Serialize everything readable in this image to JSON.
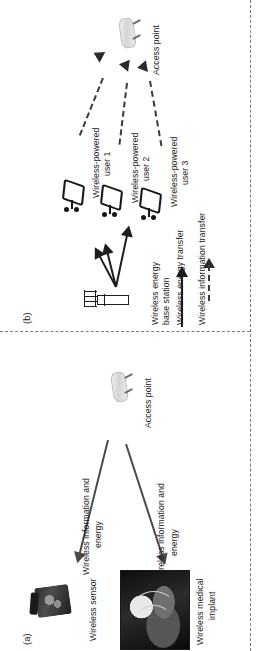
{
  "figure": {
    "orientation": "rotated-90",
    "panels": [
      {
        "id": "panel-a",
        "label": "(a)",
        "nodes": [
          {
            "name": "access-point",
            "label": "Access point",
            "icon": "wireless-router-icon"
          },
          {
            "name": "wireless-sensor",
            "label": "Wireless sensor",
            "icon": "sensor-photo"
          },
          {
            "name": "wireless-medical-implant",
            "label": "Wireless medical\nimplant",
            "label_line1": "Wireless medical",
            "label_line2": "implant",
            "icon": "xray-torso-photo"
          }
        ],
        "edges": [
          {
            "name": "edge-ap-to-sensor",
            "label_line1": "Wireless information and",
            "label_line2": "energy",
            "style": "solid-arrow"
          },
          {
            "name": "edge-ap-to-implant",
            "label_line1": "Wireless information and",
            "label_line2": "energy",
            "style": "solid-arrow"
          }
        ]
      },
      {
        "id": "panel-b",
        "label": "(b)",
        "nodes": [
          {
            "name": "access-point",
            "label": "Access point",
            "icon": "wireless-router-icon"
          },
          {
            "name": "wireless-energy-base-station",
            "label_line1": "Wireless energy",
            "label_line2": "base station",
            "icon": "antenna-tower-icon"
          },
          {
            "name": "wireless-powered-user-1",
            "label_line1": "Wireless-powered",
            "label_line2": "user 1",
            "icon": "user-terminal-icon"
          },
          {
            "name": "wireless-powered-user-2",
            "label_line1": "Wireless-powered",
            "label_line2": "user 2",
            "icon": "user-terminal-icon"
          },
          {
            "name": "wireless-powered-user-3",
            "label_line1": "Wireless-powered",
            "label_line2": "user 3",
            "icon": "user-terminal-icon"
          }
        ],
        "legend": [
          {
            "name": "legend-energy-transfer",
            "label": "Wireless energy transfer",
            "glyph": "solid-arrow-icon"
          },
          {
            "name": "legend-information-transfer",
            "label": "Wireless information transfer",
            "glyph": "dashed-arrow-icon"
          }
        ]
      }
    ]
  },
  "colors": {
    "arrow": "#4a4a4a",
    "arrow_dark": "#1d1d1d",
    "text": "#1b1b1b",
    "divider": "#7a7a7a",
    "background": "#ffffff"
  }
}
